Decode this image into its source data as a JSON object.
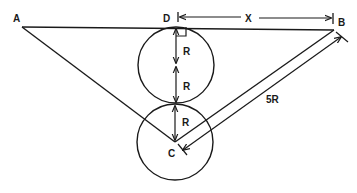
{
  "diagram": {
    "type": "geometry",
    "labels": {
      "A": "A",
      "B": "B",
      "C": "C",
      "D": "D",
      "X": "X",
      "R_top_upper": "R",
      "R_top_lower": "R",
      "R_bottom": "R",
      "five_R": "5R"
    },
    "points": {
      "A": [
        22,
        27
      ],
      "D": [
        176,
        27
      ],
      "B": [
        334,
        30
      ],
      "C": [
        175,
        142
      ],
      "tangent": [
        175,
        104
      ]
    },
    "circles": [
      {
        "name": "upper",
        "cx": 176,
        "cy": 65,
        "r": 38
      },
      {
        "name": "lower",
        "cx": 175,
        "cy": 142,
        "r": 38
      }
    ],
    "stroke_color": "#1a1a1a"
  }
}
